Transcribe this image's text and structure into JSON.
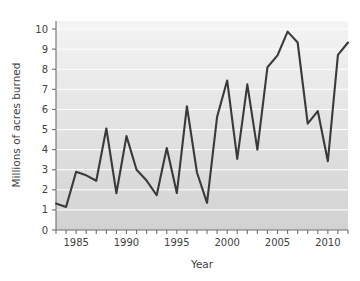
{
  "chart_data": {
    "type": "line",
    "title": "",
    "xlabel": "Year",
    "ylabel": "Millions of acres burned",
    "xlim": [
      1983,
      2012
    ],
    "ylim": [
      0,
      10.4
    ],
    "grid": true,
    "legend": "none",
    "x_tick_labels": [
      "1985",
      "1990",
      "1995",
      "2000",
      "2005",
      "2010"
    ],
    "x_tick_values": [
      1985,
      1990,
      1995,
      2000,
      2005,
      2010
    ],
    "x_minor_tick_interval": 1,
    "y_tick_labels": [
      "0",
      "1",
      "2",
      "3",
      "4",
      "5",
      "6",
      "7",
      "8",
      "9",
      "10"
    ],
    "y_tick_values": [
      0,
      1,
      2,
      3,
      4,
      5,
      6,
      7,
      8,
      9,
      10
    ],
    "series": [
      {
        "name": "Acres burned",
        "color": "#3a3a3a",
        "x": [
          1983,
          1984,
          1985,
          1986,
          1987,
          1988,
          1989,
          1990,
          1991,
          1992,
          1993,
          1994,
          1995,
          1996,
          1997,
          1998,
          1999,
          2000,
          2001,
          2002,
          2003,
          2004,
          2005,
          2006,
          2007,
          2008,
          2009,
          2010,
          2011,
          2012
        ],
        "values": [
          1.32,
          1.15,
          2.9,
          2.72,
          2.45,
          5.05,
          1.83,
          4.67,
          3.0,
          2.46,
          1.73,
          4.08,
          1.84,
          6.15,
          2.86,
          1.35,
          5.63,
          7.44,
          3.54,
          7.25,
          4.0,
          8.1,
          8.69,
          9.87,
          9.33,
          5.29,
          5.92,
          3.42,
          8.71,
          9.33
        ]
      }
    ]
  },
  "axes": {
    "x_title": "Year",
    "y_title": "Millions of acres burned"
  },
  "style": {
    "line_color": "#3a3a3a",
    "plot_bg_top": "#f2f2f2",
    "plot_bg_bottom": "#d3d3d3",
    "gridline_color": "#ffffff",
    "axis_color": "#6e6e6e",
    "page_bg": "#ffffff"
  }
}
